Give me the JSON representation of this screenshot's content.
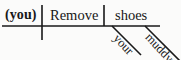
{
  "diagram": {
    "type": "reed-kellogg-sentence-diagram",
    "sentence": "(you) Remove your muddy shoes",
    "ink_color": "#181818",
    "background_color": "#fbfbfa",
    "baseline": {
      "label": "horizontal-baseline",
      "x1": 2,
      "y": 26,
      "x2": 160
    },
    "dividers": [
      {
        "name": "subject-verb-divider",
        "x": 42,
        "y1": 5,
        "y2": 40,
        "crosses_baseline": true
      },
      {
        "name": "verb-object-divider",
        "x": 104,
        "y1": 5,
        "y2": 26,
        "crosses_baseline": false
      }
    ],
    "slots": {
      "subject": {
        "text": "(you)",
        "role": "understood-subject",
        "bold": true
      },
      "verb": {
        "text": "Remove",
        "role": "predicate-verb",
        "bold": false
      },
      "direct_object": {
        "text": "shoes",
        "role": "direct-object",
        "bold": false
      }
    },
    "modifiers": [
      {
        "text": "your",
        "role": "possessive-modifier",
        "modifies": "shoes",
        "line": {
          "x1": 112,
          "y1": 26,
          "x2": 140,
          "y2": 54
        }
      },
      {
        "text": "muddy",
        "role": "adjective-modifier",
        "modifies": "shoes",
        "clipped_at_right_edge": true,
        "line": {
          "x1": 145,
          "y1": 26,
          "x2": 181,
          "y2": 60
        }
      }
    ]
  }
}
